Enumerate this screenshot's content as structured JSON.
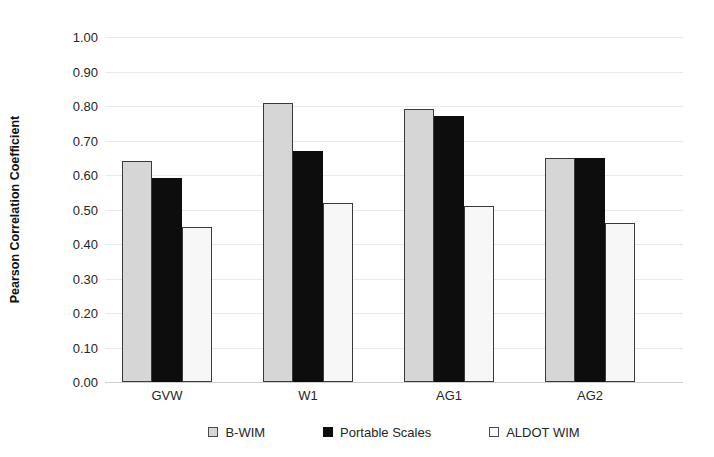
{
  "chart_data": {
    "type": "bar",
    "title": "",
    "xlabel": "",
    "ylabel": "Pearson Correlation Coefficient",
    "categories": [
      "GVW",
      "W1",
      "AG1",
      "AG2"
    ],
    "series": [
      {
        "name": "B-WIM",
        "color": "#d6d6d6",
        "values": [
          0.64,
          0.81,
          0.79,
          0.65
        ]
      },
      {
        "name": "Portable Scales",
        "color": "#0d0d0d",
        "values": [
          0.59,
          0.67,
          0.77,
          0.65
        ]
      },
      {
        "name": "ALDOT WIM",
        "color": "#ffffff",
        "values": [
          0.45,
          0.52,
          0.51,
          0.46
        ]
      }
    ],
    "ylim": [
      0.0,
      1.0
    ],
    "ytick_step": 0.1,
    "ytick_labels": [
      "1.00",
      "0.90",
      "0.80",
      "0.70",
      "0.60",
      "0.50",
      "0.40",
      "0.30",
      "0.20",
      "0.10",
      "0.00"
    ],
    "ytick_values": [
      1.0,
      0.9,
      0.8,
      0.7,
      0.6,
      0.5,
      0.4,
      0.3,
      0.2,
      0.1,
      0.0
    ],
    "grid": true,
    "grid_axis": "y",
    "legend_position": "bottom",
    "legend_entries": [
      "B-WIM",
      "Portable Scales",
      "ALDOT WIM"
    ],
    "annotations": [],
    "colors": {
      "series_b_wim": "#d6d6d6",
      "series_portable_scales": "#0d0d0d",
      "series_aldot_wim": "#ffffff",
      "bar_border": "#3a3a3a",
      "gridline": "#e9e9e9",
      "baseline": "#cfcfcf",
      "text": "#262626",
      "background": "#ffffff"
    }
  }
}
